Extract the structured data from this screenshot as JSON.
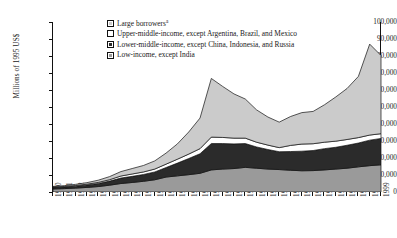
{
  "axes": {
    "ylabel": "Millions of 1995 US$",
    "yticks": [
      "0",
      "10,000",
      "20,000",
      "30,000",
      "40,000",
      "50,000",
      "60,000",
      "70,000",
      "80,000",
      "90,000",
      "100,000"
    ],
    "xticks": [
      "1970",
      "1971",
      "1972",
      "1973",
      "1974",
      "1975",
      "1976",
      "1977",
      "1978",
      "1979",
      "1980",
      "1981",
      "1982",
      "1983",
      "1984",
      "1985",
      "1986",
      "1987",
      "1988",
      "1989",
      "1990",
      "1991",
      "1992",
      "1993",
      "1994",
      "1995",
      "1996",
      "1997",
      "1998",
      "1999"
    ]
  },
  "legend": {
    "items": [
      {
        "label": "Large borrowers",
        "superscript": "a",
        "color": "#cbcbcb",
        "name": "legend-item-large-borrowers"
      },
      {
        "label": "Upper-middle-income, except Argentina, Brazil, and Mexico",
        "superscript": "",
        "color": "#ffffff",
        "name": "legend-item-upper-middle-income"
      },
      {
        "label": "Lower-middle-income, except China, Indonesia, and Russia",
        "superscript": "",
        "color": "#2b2b2b",
        "name": "legend-item-lower-middle-income"
      },
      {
        "label": "Low-income, except India",
        "superscript": "",
        "color": "#9a9a9a",
        "name": "legend-item-low-income"
      }
    ]
  },
  "chart_data": {
    "type": "area",
    "stacked": true,
    "title": "",
    "xlabel": "",
    "ylabel": "Millions of 1995 US$",
    "ylim": [
      0,
      100000
    ],
    "ytick_step": 10000,
    "grid": false,
    "legend_position": "top-center",
    "x": [
      1970,
      1971,
      1972,
      1973,
      1974,
      1975,
      1976,
      1977,
      1978,
      1979,
      1980,
      1981,
      1982,
      1983,
      1984,
      1985,
      1986,
      1987,
      1988,
      1989,
      1990,
      1991,
      1992,
      1993,
      1994,
      1995,
      1996,
      1997,
      1998,
      1999
    ],
    "series": [
      {
        "name": "Low-income, except India",
        "color": "#9a9a9a",
        "stack_order": 1,
        "values": [
          1800,
          2000,
          2300,
          2700,
          3200,
          4000,
          5000,
          5600,
          6300,
          7200,
          8800,
          9500,
          10200,
          11000,
          13000,
          13500,
          13800,
          14500,
          14000,
          13500,
          13200,
          12800,
          12500,
          12600,
          13000,
          13500,
          14000,
          14800,
          15500,
          16000
        ]
      },
      {
        "name": "Lower-middle-income, except China, Indonesia, and Russia",
        "color": "#2b2b2b",
        "stack_order": 2,
        "values": [
          800,
          900,
          1100,
          1400,
          1800,
          2400,
          3200,
          3600,
          4000,
          4600,
          5600,
          7500,
          9500,
          11500,
          15500,
          15000,
          14500,
          14000,
          12500,
          11500,
          10500,
          11000,
          11500,
          11800,
          12500,
          12800,
          13500,
          14000,
          15000,
          15500
        ]
      },
      {
        "name": "Upper-middle-income, except Argentina, Brazil, and Mexico",
        "color": "#ffffff",
        "stack_order": 3,
        "values": [
          300,
          350,
          420,
          500,
          650,
          850,
          1200,
          1400,
          1500,
          1700,
          2000,
          2300,
          2600,
          3000,
          3800,
          3600,
          3400,
          3200,
          2800,
          2600,
          2400,
          3600,
          4200,
          4000,
          3800,
          3600,
          3400,
          3200,
          3000,
          2800
        ]
      },
      {
        "name": "Large borrowers",
        "color": "#cbcbcb",
        "stack_order": 4,
        "values": [
          400,
          500,
          700,
          900,
          1300,
          1800,
          2600,
          3200,
          3800,
          4800,
          6500,
          9000,
          13000,
          18000,
          34500,
          30000,
          26000,
          23000,
          19000,
          16500,
          15000,
          17000,
          18500,
          19000,
          22000,
          26000,
          30000,
          36000,
          53500,
          46000
        ]
      }
    ],
    "peak_total_1984": 66800,
    "peak_total_1998": 87000,
    "total_1999": 80300
  }
}
